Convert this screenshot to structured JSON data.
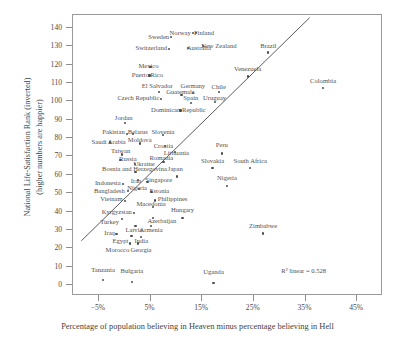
{
  "chart_data": {
    "type": "scatter",
    "title": "",
    "xlabel": "Percentage of population believing in Heaven minus percentage believing in Hell",
    "ylabel": "National Life-Satisfaction Rank (inverted)\n(higher numbers are happier)",
    "xlim": [
      -10,
      50
    ],
    "ylim": [
      -6,
      147
    ],
    "xticks": [
      -5,
      5,
      15,
      25,
      35,
      45
    ],
    "xticklabels": [
      "−5%",
      "5%",
      "15%",
      "25%",
      "35%",
      "45%"
    ],
    "yticks": [
      0,
      10,
      20,
      30,
      40,
      50,
      60,
      70,
      80,
      90,
      100,
      110,
      120,
      130,
      140
    ],
    "yticklabels": [
      "0",
      "10",
      "20",
      "30",
      "40",
      "50",
      "60",
      "70",
      "80",
      "90",
      "100",
      "110",
      "120",
      "130",
      "140"
    ],
    "grid": false,
    "legend": null,
    "annotation": "R² linear = 0.528",
    "fit": {
      "type": "linear",
      "r_squared": 0.528,
      "x0": -8.2,
      "y0": 23.5,
      "x1": 36.0,
      "y1": 145.0
    },
    "points": [
      {
        "label": "Tanzania",
        "x": -4.0,
        "y": 2.0,
        "lx": -4.0,
        "ly": 7.5,
        "a": "c"
      },
      {
        "label": "Bulgaria",
        "x": 1.6,
        "y": 1.0,
        "lx": 1.6,
        "ly": 7.0,
        "a": "c"
      },
      {
        "label": "Uganda",
        "x": 17.4,
        "y": 0.5,
        "lx": 17.4,
        "ly": 6.5,
        "a": "c"
      },
      {
        "label": "Morocco",
        "x": 1.2,
        "y": 22.0,
        "lx": 1.1,
        "ly": 18.5,
        "a": "r"
      },
      {
        "label": "Georgia",
        "x": 2.7,
        "y": 22.0,
        "lx": 1.3,
        "ly": 18.5,
        "a": "l"
      },
      {
        "label": "Iraq",
        "x": -1.4,
        "y": 27.0,
        "lx": -1.7,
        "ly": 27.5,
        "a": "r"
      },
      {
        "label": "Egypt",
        "x": 1.5,
        "y": 26.0,
        "lx": 0.9,
        "ly": 23.5,
        "a": "r"
      },
      {
        "label": "India",
        "x": 3.4,
        "y": 25.5,
        "lx": 2.1,
        "ly": 23.5,
        "a": "l"
      },
      {
        "label": "Zimbabwe",
        "x": 27.0,
        "y": 27.5,
        "lx": 27.0,
        "ly": 31.5,
        "a": "c"
      },
      {
        "label": "Turkey",
        "x": -0.3,
        "y": 35.5,
        "lx": -0.9,
        "ly": 34.0,
        "a": "r"
      },
      {
        "label": "Latvia",
        "x": 2.3,
        "y": 31.5,
        "lx": 2.0,
        "ly": 29.5,
        "a": "c"
      },
      {
        "label": "Armenia",
        "x": 5.3,
        "y": 31.5,
        "lx": 5.3,
        "ly": 29.5,
        "a": "c"
      },
      {
        "label": "Kyrgyzstan",
        "x": 2.0,
        "y": 38.5,
        "lx": 1.6,
        "ly": 39.0,
        "a": "r"
      },
      {
        "label": "Azerbaijan",
        "x": 5.6,
        "y": 36.0,
        "lx": 4.6,
        "ly": 34.5,
        "a": "l"
      },
      {
        "label": "Hungary",
        "x": 11.4,
        "y": 36.0,
        "lx": 11.4,
        "ly": 40.5,
        "a": "c"
      },
      {
        "label": "Macedonia",
        "x": 5.6,
        "y": 42.0,
        "lx": 5.3,
        "ly": 43.5,
        "a": "c"
      },
      {
        "label": "Vietnam",
        "x": 0.2,
        "y": 45.0,
        "lx": -0.2,
        "ly": 46.0,
        "a": "r"
      },
      {
        "label": "Philippines",
        "x": 6.1,
        "y": 45.5,
        "lx": 6.6,
        "ly": 46.0,
        "a": "l"
      },
      {
        "label": "Bangladesh",
        "x": 0.9,
        "y": 50.5,
        "lx": 0.2,
        "ly": 50.5,
        "a": "r"
      },
      {
        "label": "Nigeria",
        "x": 3.0,
        "y": 51.5,
        "lx": 2.6,
        "ly": 52.0,
        "a": "c"
      },
      {
        "label": "Estonia",
        "x": 5.4,
        "y": 50.0,
        "lx": 5.0,
        "ly": 50.5,
        "a": "l"
      },
      {
        "label": "Indonesia",
        "x": -0.2,
        "y": 54.5,
        "lx": -0.6,
        "ly": 55.0,
        "a": "r"
      },
      {
        "label": "Iran",
        "x": 2.7,
        "y": 56.5,
        "lx": 2.4,
        "ly": 56.0,
        "a": "c"
      },
      {
        "label": "Singapore",
        "x": 4.6,
        "y": 55.5,
        "lx": 4.2,
        "ly": 56.5,
        "a": "l"
      },
      {
        "label": "Nigeria ",
        "x": 20.0,
        "y": 53.5,
        "lx": 20.0,
        "ly": 57.5,
        "a": "c"
      },
      {
        "label": "Bosnia and Herzegovina",
        "x": 2.3,
        "y": 61.0,
        "lx": 2.1,
        "ly": 62.5,
        "a": "c"
      },
      {
        "label": "Japan",
        "x": 10.3,
        "y": 58.5,
        "lx": 10.0,
        "ly": 62.5,
        "a": "c"
      },
      {
        "label": "Ukraine",
        "x": 2.2,
        "y": 65.5,
        "lx": 1.9,
        "ly": 65.5,
        "a": "l"
      },
      {
        "label": "Romania",
        "x": 7.7,
        "y": 66.5,
        "lx": 7.3,
        "ly": 68.5,
        "a": "c"
      },
      {
        "label": "Russia",
        "x": -0.6,
        "y": 67.5,
        "lx": -0.9,
        "ly": 68.0,
        "a": "l"
      },
      {
        "label": "Taiwan",
        "x": -0.4,
        "y": 70.5,
        "lx": -0.6,
        "ly": 72.5,
        "a": "c"
      },
      {
        "label": "Saudi Arabia",
        "x": -2.6,
        "y": 77.0,
        "lx": -2.9,
        "ly": 77.5,
        "a": "c"
      },
      {
        "label": "Moldova",
        "x": 3.2,
        "y": 76.5,
        "lx": 3.1,
        "ly": 78.5,
        "a": "c"
      },
      {
        "label": "Croatia",
        "x": 8.0,
        "y": 75.0,
        "lx": 7.7,
        "ly": 75.0,
        "a": "c"
      },
      {
        "label": "Lithuania",
        "x": 10.0,
        "y": 72.0,
        "lx": 10.2,
        "ly": 71.5,
        "a": "c"
      },
      {
        "label": "Pakistan",
        "x": 0.6,
        "y": 81.5,
        "lx": 0.2,
        "ly": 82.5,
        "a": "r"
      },
      {
        "label": "Belarus",
        "x": 1.8,
        "y": 81.5,
        "lx": 0.8,
        "ly": 82.5,
        "a": "l"
      },
      {
        "label": "Slovenia",
        "x": 7.6,
        "y": 81.0,
        "lx": 7.6,
        "ly": 82.5,
        "a": "c"
      },
      {
        "label": "Jordan",
        "x": 0.2,
        "y": 87.5,
        "lx": 0.0,
        "ly": 90.5,
        "a": "c"
      },
      {
        "label": "Dominican Republic",
        "x": 11.0,
        "y": 94.5,
        "lx": 10.6,
        "ly": 94.5,
        "a": "c"
      },
      {
        "label": "Peru",
        "x": 19.0,
        "y": 71.0,
        "lx": 19.0,
        "ly": 75.5,
        "a": "c"
      },
      {
        "label": "Slovakia",
        "x": 17.2,
        "y": 63.0,
        "lx": 17.2,
        "ly": 67.0,
        "a": "c"
      },
      {
        "label": "South Africa",
        "x": 24.5,
        "y": 63.0,
        "lx": 24.5,
        "ly": 67.0,
        "a": "c"
      },
      {
        "label": "Czech Republic",
        "x": 7.3,
        "y": 100.5,
        "lx": 6.9,
        "ly": 101.0,
        "a": "r"
      },
      {
        "label": "Spain",
        "x": 13.0,
        "y": 98.5,
        "lx": 13.0,
        "ly": 101.5,
        "a": "c"
      },
      {
        "label": "Guatemala",
        "x": 11.2,
        "y": 103.0,
        "lx": 11.0,
        "ly": 104.5,
        "a": "c"
      },
      {
        "label": "Germany",
        "x": 13.4,
        "y": 104.0,
        "lx": 13.4,
        "ly": 108.0,
        "a": "c"
      },
      {
        "label": "El Salvador",
        "x": 6.8,
        "y": 104.5,
        "lx": 6.5,
        "ly": 108.0,
        "a": "c"
      },
      {
        "label": "Uruguay",
        "x": 17.6,
        "y": 99.0,
        "lx": 17.6,
        "ly": 101.5,
        "a": "c"
      },
      {
        "label": "Chile",
        "x": 18.4,
        "y": 104.5,
        "lx": 18.4,
        "ly": 107.5,
        "a": "c"
      },
      {
        "label": "Puerto Rico",
        "x": 5.0,
        "y": 113.5,
        "lx": 4.6,
        "ly": 114.0,
        "a": "c"
      },
      {
        "label": "Mexico",
        "x": 5.2,
        "y": 118.0,
        "lx": 4.8,
        "ly": 118.5,
        "a": "c"
      },
      {
        "label": "Venezuela",
        "x": 24.0,
        "y": 113.0,
        "lx": 24.0,
        "ly": 117.0,
        "a": "c"
      },
      {
        "label": "Switzerland",
        "x": 8.8,
        "y": 128.0,
        "lx": 8.4,
        "ly": 128.5,
        "a": "r"
      },
      {
        "label": "Australia",
        "x": 12.5,
        "y": 128.5,
        "lx": 12.2,
        "ly": 128.5,
        "a": "l"
      },
      {
        "label": "New Zealand",
        "x": 15.4,
        "y": 129.5,
        "lx": 15.0,
        "ly": 129.5,
        "a": "l"
      },
      {
        "label": "Sweden",
        "x": 9.2,
        "y": 134.5,
        "lx": 8.8,
        "ly": 134.5,
        "a": "r"
      },
      {
        "label": "Norway",
        "x": 13.4,
        "y": 136.5,
        "lx": 13.0,
        "ly": 136.5,
        "a": "r"
      },
      {
        "label": "Finland",
        "x": 14.0,
        "y": 136.5,
        "lx": 13.6,
        "ly": 136.5,
        "a": "l"
      },
      {
        "label": "Brazil",
        "x": 28.0,
        "y": 126.0,
        "lx": 28.0,
        "ly": 129.5,
        "a": "c"
      },
      {
        "label": "Colombia",
        "x": 38.6,
        "y": 106.5,
        "lx": 38.6,
        "ly": 110.5,
        "a": "c"
      }
    ]
  }
}
